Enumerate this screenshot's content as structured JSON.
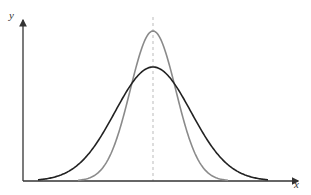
{
  "chart_data": {
    "type": "line",
    "title": "",
    "xlabel": "x",
    "ylabel": "y",
    "grid": false,
    "legend": "none",
    "annotations": [
      "dashed vertical line at the common mean (peak location)"
    ],
    "series": [
      {
        "name": "narrow normal curve (smaller spread)",
        "color": "#8a8a8a",
        "mean": 0,
        "relative_peak_height": 1.0,
        "relative_spread": 0.6
      },
      {
        "name": "wide normal curve (larger spread)",
        "color": "#222222",
        "mean": 0,
        "relative_peak_height": 0.76,
        "relative_spread": 1.0
      }
    ]
  },
  "labels": {
    "x_axis": "x",
    "y_axis": "y"
  },
  "colors": {
    "axis": "#333333",
    "narrow_curve": "#8a8a8a",
    "wide_curve": "#222222",
    "mean_line": "#bbbbbb"
  }
}
